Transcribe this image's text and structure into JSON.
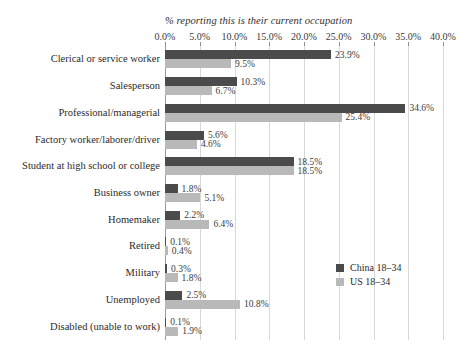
{
  "chart_data": {
    "type": "bar",
    "orientation": "horizontal",
    "title": "",
    "xlabel": "% reporting this is their current occupation",
    "ylabel": "",
    "xlim": [
      0,
      40
    ],
    "xticks": [
      "0.0%",
      "5.0%",
      "10.0%",
      "15.0%",
      "20.0%",
      "25.0%",
      "30.0%",
      "35.0%",
      "40.0%"
    ],
    "xtick_values": [
      0,
      5,
      10,
      15,
      20,
      25,
      30,
      35,
      40
    ],
    "grid": true,
    "legend_position": "right-middle",
    "categories": [
      "Clerical or service worker",
      "Salesperson",
      "Professional/managerial",
      "Factory worker/laborer/driver",
      "Student at high school or college",
      "Business owner",
      "Homemaker",
      "Retired",
      "Military",
      "Unemployed",
      "Disabled (unable to work)"
    ],
    "series": [
      {
        "name": "China 18–34",
        "color": "#4b4b4b",
        "values": [
          23.9,
          10.3,
          34.6,
          5.6,
          18.5,
          1.8,
          2.2,
          0.1,
          0.3,
          2.5,
          0.1
        ],
        "labels": [
          "23.9%",
          "10.3%",
          "34.6%",
          "5.6%",
          "18.5%",
          "1.8%",
          "2.2%",
          "0.1%",
          "0.3%",
          "2.5%",
          "0.1%"
        ]
      },
      {
        "name": "US 18–34",
        "color": "#b9b9b9",
        "values": [
          9.5,
          6.7,
          25.4,
          4.6,
          18.5,
          5.1,
          6.4,
          0.4,
          1.8,
          10.8,
          1.9
        ],
        "labels": [
          "9.5%",
          "6.7%",
          "25.4%",
          "4.6%",
          "18.5%",
          "5.1%",
          "6.4%",
          "0.4%",
          "1.8%",
          "10.8%",
          "1.9%"
        ]
      }
    ]
  },
  "legend": {
    "items": [
      {
        "label": "China 18–34"
      },
      {
        "label": "US 18–34"
      }
    ]
  }
}
